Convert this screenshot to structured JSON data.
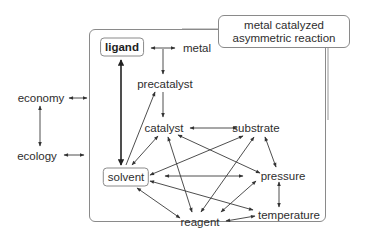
{
  "title": {
    "line1": "metal catalyzed",
    "line2": "asymmetric reaction"
  },
  "nodes": {
    "ligand": "ligand",
    "metal": "metal",
    "precatalyst": "precatalyst",
    "catalyst": "catalyst",
    "substrate": "substrate",
    "solvent": "solvent",
    "pressure": "pressure",
    "temperature": "temperature",
    "reagent": "reagent",
    "economy": "economy",
    "ecology": "ecology"
  },
  "edges": [
    {
      "from": "ligand",
      "to": "metal",
      "type": "bidirectional"
    },
    {
      "from": "metal",
      "to": "precatalyst",
      "type": "directed"
    },
    {
      "from": "precatalyst",
      "to": "catalyst",
      "type": "directed"
    },
    {
      "from": "ligand",
      "to": "solvent",
      "type": "bidirectional-bold"
    },
    {
      "from": "solvent",
      "to": "precatalyst",
      "type": "directed"
    },
    {
      "from": "catalyst",
      "to": "solvent",
      "type": "bidirectional"
    },
    {
      "from": "catalyst",
      "to": "substrate",
      "type": "bidirectional"
    },
    {
      "from": "catalyst",
      "to": "pressure",
      "type": "bidirectional"
    },
    {
      "from": "catalyst",
      "to": "reagent",
      "type": "bidirectional"
    },
    {
      "from": "substrate",
      "to": "solvent",
      "type": "bidirectional"
    },
    {
      "from": "substrate",
      "to": "reagent",
      "type": "bidirectional"
    },
    {
      "from": "substrate",
      "to": "pressure",
      "type": "bidirectional"
    },
    {
      "from": "solvent",
      "to": "pressure",
      "type": "bidirectional"
    },
    {
      "from": "solvent",
      "to": "temperature",
      "type": "bidirectional"
    },
    {
      "from": "solvent",
      "to": "reagent",
      "type": "bidirectional"
    },
    {
      "from": "pressure",
      "to": "reagent",
      "type": "bidirectional"
    },
    {
      "from": "pressure",
      "to": "temperature",
      "type": "bidirectional"
    },
    {
      "from": "reagent",
      "to": "temperature",
      "type": "bidirectional"
    },
    {
      "from": "economy",
      "to": "frame",
      "type": "bidirectional"
    },
    {
      "from": "ecology",
      "to": "frame",
      "type": "bidirectional"
    },
    {
      "from": "economy",
      "to": "ecology",
      "type": "bidirectional"
    }
  ],
  "colors": {
    "line": "#3a3a3a",
    "border": "#8a8a8a",
    "text": "#2e2e2e"
  }
}
